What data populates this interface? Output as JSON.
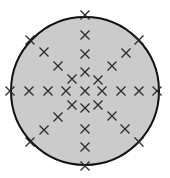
{
  "diagram": {
    "colors": {
      "background": "#ffffff",
      "circle_fill": "#cbcbcb",
      "circle_stroke": "#111111",
      "marker": "#2a2a2a"
    },
    "circle": {
      "cx": 85,
      "cy": 91,
      "r": 74
    },
    "marker_size": 4.5,
    "markers": [
      {
        "x": 85,
        "y": 15
      },
      {
        "x": 85,
        "y": 35
      },
      {
        "x": 85,
        "y": 54
      },
      {
        "x": 85,
        "y": 72
      },
      {
        "x": 85,
        "y": 91
      },
      {
        "x": 85,
        "y": 108
      },
      {
        "x": 85,
        "y": 129
      },
      {
        "x": 85,
        "y": 147
      },
      {
        "x": 85,
        "y": 166
      },
      {
        "x": 10,
        "y": 91
      },
      {
        "x": 29,
        "y": 91
      },
      {
        "x": 48,
        "y": 91
      },
      {
        "x": 66,
        "y": 91
      },
      {
        "x": 102,
        "y": 91
      },
      {
        "x": 121,
        "y": 91
      },
      {
        "x": 139,
        "y": 91
      },
      {
        "x": 157,
        "y": 91
      },
      {
        "x": 30,
        "y": 40
      },
      {
        "x": 44,
        "y": 52
      },
      {
        "x": 58,
        "y": 66
      },
      {
        "x": 72,
        "y": 79
      },
      {
        "x": 139,
        "y": 40
      },
      {
        "x": 126,
        "y": 53
      },
      {
        "x": 112,
        "y": 66
      },
      {
        "x": 98,
        "y": 80
      },
      {
        "x": 30,
        "y": 142
      },
      {
        "x": 44,
        "y": 130
      },
      {
        "x": 58,
        "y": 117
      },
      {
        "x": 72,
        "y": 105
      },
      {
        "x": 139,
        "y": 142
      },
      {
        "x": 125,
        "y": 129
      },
      {
        "x": 112,
        "y": 116
      },
      {
        "x": 98,
        "y": 105
      }
    ]
  }
}
